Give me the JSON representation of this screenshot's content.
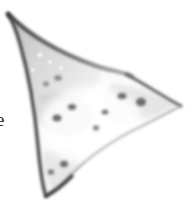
{
  "figure": {
    "kind": "scanned-specimen-photograph",
    "background_color": "#ffffff",
    "width_px": 190,
    "height_px": 212,
    "description_visible": "grayscale triangular arrowhead-shaped specimen on white background"
  },
  "margin_caption": {
    "visible_text": "e",
    "note_position": "left edge, vertically centered, clipped by image crop"
  },
  "specimen": {
    "outline_color": "#3b3b3b",
    "body_fill_light": "#fbfbfb",
    "body_fill_mid": "#d8d8d8",
    "body_fill_dark": "#c2c2c2",
    "speck_color": "#6e6e6e",
    "highlight_color": "#ffffff",
    "tips": [
      {
        "name": "upper-left-tip",
        "x": 8,
        "y": 14
      },
      {
        "name": "right-tip",
        "x": 181,
        "y": 106
      },
      {
        "name": "lower-tip",
        "x": 46,
        "y": 196
      }
    ],
    "concavity": {
      "name": "upper-right-notch",
      "x": 122,
      "y": 72
    },
    "spots": [
      {
        "x": 122,
        "y": 96,
        "rx": 4.5,
        "ry": 3.2,
        "tone": "#707070"
      },
      {
        "x": 141,
        "y": 102,
        "rx": 5.0,
        "ry": 4.2,
        "tone": "#6a6a6a"
      },
      {
        "x": 105,
        "y": 112,
        "rx": 3.4,
        "ry": 2.6,
        "tone": "#787878"
      },
      {
        "x": 96,
        "y": 128,
        "rx": 3.0,
        "ry": 2.4,
        "tone": "#7d7d7d"
      },
      {
        "x": 72,
        "y": 107,
        "rx": 4.2,
        "ry": 3.0,
        "tone": "#6f6f6f"
      },
      {
        "x": 57,
        "y": 118,
        "rx": 4.6,
        "ry": 3.6,
        "tone": "#6c6c6c"
      },
      {
        "x": 64,
        "y": 164,
        "rx": 4.0,
        "ry": 3.2,
        "tone": "#6b6b6b"
      },
      {
        "x": 51,
        "y": 172,
        "rx": 3.2,
        "ry": 2.6,
        "tone": "#767676"
      },
      {
        "x": 58,
        "y": 78,
        "rx": 3.8,
        "ry": 2.8,
        "tone": "#8a8a8a"
      },
      {
        "x": 46,
        "y": 84,
        "rx": 3.0,
        "ry": 2.4,
        "tone": "#8f8f8f"
      }
    ],
    "highlights": [
      {
        "x": 40,
        "y": 55,
        "r": 2.0
      },
      {
        "x": 50,
        "y": 62,
        "r": 1.7
      },
      {
        "x": 33,
        "y": 70,
        "r": 1.6
      },
      {
        "x": 61,
        "y": 68,
        "r": 1.8
      },
      {
        "x": 46,
        "y": 118,
        "r": 1.8
      },
      {
        "x": 67,
        "y": 128,
        "r": 1.6
      },
      {
        "x": 112,
        "y": 99,
        "r": 1.6
      },
      {
        "x": 130,
        "y": 118,
        "r": 1.5
      },
      {
        "x": 88,
        "y": 93,
        "r": 1.7
      },
      {
        "x": 79,
        "y": 160,
        "r": 1.5
      }
    ]
  }
}
